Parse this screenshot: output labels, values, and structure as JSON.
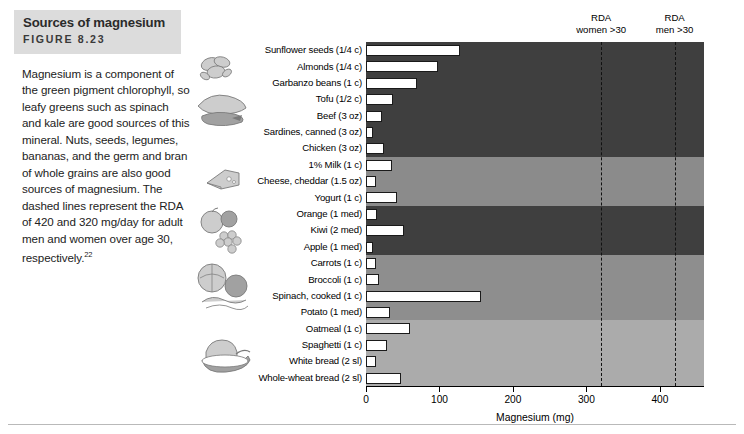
{
  "figure": {
    "title": "Sources of magnesium",
    "number": "FIGURE 8.23",
    "caption": "Magnesium is a component of the green pigment chlorophyll, so leafy greens such as spinach and kale are good sources of this mineral. Nuts, seeds, legumes, bananas, and the germ and bran of whole grains are also good sources of magnesium. The dashed lines represent the RDA of 420 and 320 mg/day for adult men and women over age 30, respectively.",
    "caption_superscript": "22"
  },
  "colors": {
    "band_protein": "#3f3f3f",
    "band_dairy": "#8b8b8b",
    "band_fruit": "#3f3f3f",
    "band_vegetable": "#8e8e8e",
    "band_grain": "#ababab",
    "bar_fill": "#ffffff",
    "bar_outline": "#1a1a1a",
    "rda_line": "#111111",
    "title_background": "#dcdcdc"
  },
  "chart_data": {
    "type": "bar",
    "orientation": "horizontal",
    "title": "Sources of magnesium",
    "xlabel": "Magnesium (mg)",
    "ylabel": "",
    "xlim": [
      0,
      460
    ],
    "xticks": [
      0,
      100,
      200,
      300,
      400
    ],
    "grid": false,
    "legend": "none",
    "categories": [
      "Sunflower seeds (1/4 c)",
      "Almonds  (1/4 c)",
      "Garbanzo beans (1 c)",
      "Tofu (1/2 c)",
      "Beef (3 oz)",
      "Sardines, canned (3 oz)",
      "Chicken (3 oz)",
      "1% Milk (1 c)",
      "Cheese, cheddar (1.5 oz)",
      "Yogurt (1 c)",
      "Orange (1 med)",
      "Kiwi (2 med)",
      "Apple (1 med)",
      "Carrots (1 c)",
      "Broccoli (1 c)",
      "Spinach, cooked (1 c)",
      "Potato (1 med)",
      "Oatmeal (1 c)",
      "Spaghetti (1 c)",
      "White bread (2 sl)",
      "Whole-wheat bread (2 sl)"
    ],
    "values": [
      128,
      98,
      70,
      37,
      22,
      9,
      24,
      35,
      13,
      42,
      15,
      52,
      9,
      14,
      18,
      157,
      32,
      60,
      28,
      13,
      47
    ],
    "groups": [
      {
        "name": "protein-foods",
        "items": 7,
        "color": "#3f3f3f"
      },
      {
        "name": "dairy",
        "items": 3,
        "color": "#8b8b8b"
      },
      {
        "name": "fruit",
        "items": 3,
        "color": "#3f3f3f"
      },
      {
        "name": "vegetables",
        "items": 4,
        "color": "#8e8e8e"
      },
      {
        "name": "grains",
        "items": 4,
        "color": "#ababab"
      }
    ],
    "reference_lines": [
      {
        "label_line1": "RDA",
        "label_line2": "women >30",
        "value": 320
      },
      {
        "label_line1": "RDA",
        "label_line2": "men >30",
        "value": 420
      }
    ]
  },
  "axis": {
    "tick_labels": [
      "0",
      "100",
      "200",
      "300",
      "400"
    ],
    "x_title": "Magnesium (mg)"
  },
  "illustrations": [
    "sunflower-seeds-illustration",
    "poultry-fish-illustration",
    "cheese-illustration",
    "fruit-illustration",
    "vegetables-illustration",
    "bread-bowl-illustration"
  ]
}
